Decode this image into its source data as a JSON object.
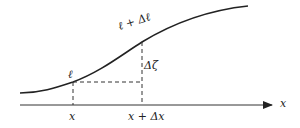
{
  "diagram": {
    "colors": {
      "stroke": "#222222",
      "background": "#ffffff"
    },
    "curve": {
      "name": "arc-length curve"
    },
    "axis": {
      "label": "x"
    },
    "points": {
      "start_label": "ℓ",
      "end_label": "ℓ + Δℓ"
    },
    "increments": {
      "vertical_label": "Δζ"
    },
    "ticks": [
      {
        "label": "x"
      },
      {
        "label": "x + Δx"
      }
    ]
  }
}
